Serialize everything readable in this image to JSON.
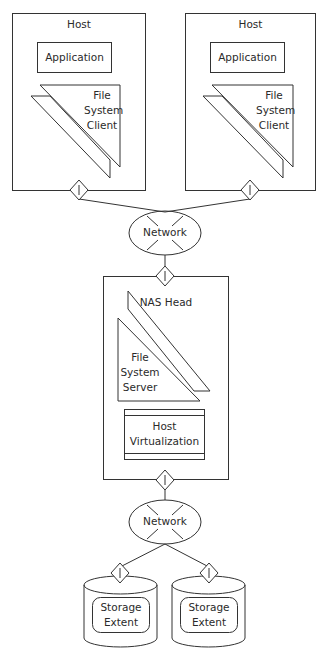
{
  "diagram": {
    "hosts": [
      {
        "label": "Host",
        "application": "Application",
        "fs_client": "File\nSystem\nClient",
        "port": "I"
      },
      {
        "label": "Host",
        "application": "Application",
        "fs_client": "File\nSystem\nClient",
        "port": "I"
      }
    ],
    "network_top": {
      "label": "Network"
    },
    "nas_head": {
      "label": "NAS Head",
      "fs_server": "File\nSystem\nServer",
      "host_virtualization": "Host\nVirtualization",
      "port_top": "I",
      "port_bottom": "I"
    },
    "network_bottom": {
      "label": "Network"
    },
    "storage": [
      {
        "label": "Storage\nExtent",
        "port": "I"
      },
      {
        "label": "Storage\nExtent",
        "port": "I"
      }
    ]
  }
}
